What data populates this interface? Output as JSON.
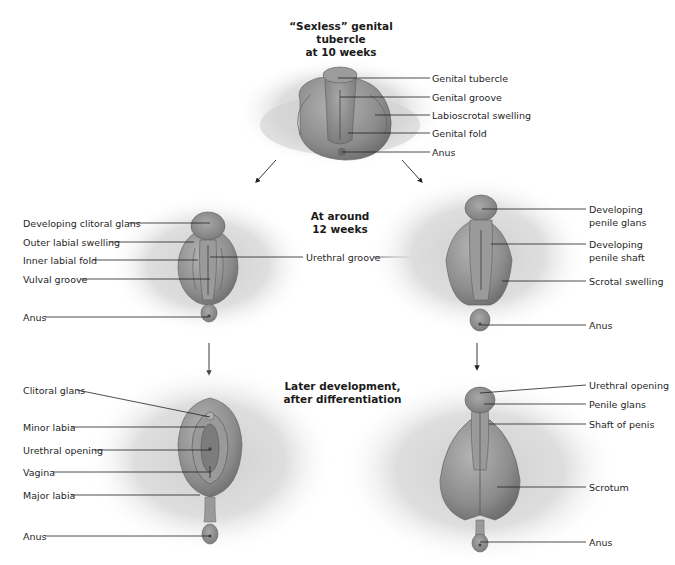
{
  "diagram": {
    "stage1": {
      "title_line1": "“Sexless” genital tubercle",
      "title_line2": "at 10 weeks",
      "labels": [
        "Genital tubercle",
        "Genital groove",
        "Labioscrotal swelling",
        "Genital fold",
        "Anus"
      ]
    },
    "stage2": {
      "title_line1": "At around",
      "title_line2": "12 weeks",
      "shared_label": "Urethral groove",
      "female_labels": [
        "Developing clitoral glans",
        "Outer labial swelling",
        "Inner labial fold",
        "Vulval groove",
        "Anus"
      ],
      "male_labels": [
        "Developing\npenile glans",
        "Developing\npenile shaft",
        "Scrotal swelling",
        "Anus"
      ],
      "male": {
        "glans_line1": "Developing",
        "glans_line2": "penile glans",
        "shaft_line1": "Developing",
        "shaft_line2": "penile shaft",
        "scrotal": "Scrotal swelling",
        "anus": "Anus"
      }
    },
    "stage3": {
      "title_line1": "Later development,",
      "title_line2": "after differentiation",
      "female_labels": [
        "Clitoral glans",
        "Minor labia",
        "Urethral opening",
        "Vagina",
        "Major labia",
        "Anus"
      ],
      "male_labels": [
        "Urethral opening",
        "Penile glans",
        "Shaft of penis",
        "Scrotum",
        "Anus"
      ]
    },
    "colors": {
      "tissue": "#8a8a8a",
      "tissue_light": "#b5b5b5",
      "shadow": "#d6d6d6",
      "leader": "#222222"
    }
  }
}
